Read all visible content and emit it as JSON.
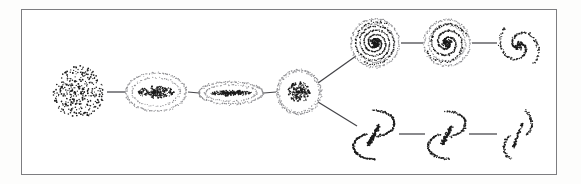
{
  "figure": {
    "background_color": "#ffffff",
    "page_color": "#fdfdfc",
    "frame": {
      "name": "figure-border",
      "x": 21,
      "y": 9,
      "width": 536,
      "height": 166,
      "stroke_color": "#7d7d80",
      "stroke_width": 1.2
    },
    "ink_color": "#1a1a1a",
    "halo_color": "#8a8a8e",
    "connector_color": "#444448"
  },
  "chart_data": {
    "type": "diagram",
    "subtitle": "",
    "xlabel": "",
    "ylabel": "",
    "legend": [],
    "grid": false,
    "render_style": "stippled point cloud",
    "branches": [
      {
        "id": "stem",
        "label": "Ellipticals and lenticular sequence",
        "node_ids": [
          "E0",
          "E3",
          "E7",
          "S0"
        ]
      },
      {
        "id": "upper",
        "label": "Normal spirals",
        "node_ids": [
          "Sa",
          "Sb",
          "Sc"
        ]
      },
      {
        "id": "lower",
        "label": "Barred spirals",
        "node_ids": [
          "SBa",
          "SBb",
          "SBc"
        ]
      }
    ],
    "nodes": [
      {
        "id": "E0",
        "label": "E0",
        "kind": "elliptical-blob",
        "branch": "stem",
        "cx": 78,
        "cy": 92,
        "rx": 26,
        "ry": 26,
        "point_count": 340,
        "core_density": 0.55,
        "halo": false
      },
      {
        "id": "E3",
        "label": "E3",
        "kind": "elliptical-ring-core",
        "branch": "stem",
        "cx": 156,
        "cy": 92,
        "rx": 30,
        "ry": 19,
        "core_rx": 18,
        "core_ry": 6,
        "point_count": 210,
        "core_density": 0.7,
        "halo": true
      },
      {
        "id": "E7",
        "label": "E7",
        "kind": "elliptical-ring-core",
        "branch": "stem",
        "cx": 231,
        "cy": 93,
        "rx": 32,
        "ry": 11,
        "core_rx": 21,
        "core_ry": 2.6,
        "point_count": 170,
        "core_density": 0.75,
        "halo": true
      },
      {
        "id": "S0",
        "label": "S0",
        "kind": "lenticular",
        "branch": "stem",
        "cx": 299,
        "cy": 92,
        "rx": 22,
        "ry": 22,
        "core_rx": 11,
        "core_ry": 10,
        "point_count": 200,
        "core_density": 0.8,
        "halo": true
      },
      {
        "id": "Sa",
        "label": "Sa",
        "kind": "spiral",
        "branch": "upper",
        "cx": 375,
        "cy": 43,
        "rx": 24,
        "ry": 24,
        "arms": 2,
        "turns": 2.35,
        "tightness": "tight",
        "point_count": 300,
        "core_density": 0.85,
        "halo": true
      },
      {
        "id": "Sb",
        "label": "Sb",
        "kind": "spiral",
        "branch": "upper",
        "cx": 447,
        "cy": 43,
        "rx": 23,
        "ry": 23,
        "arms": 2,
        "turns": 1.45,
        "tightness": "medium",
        "point_count": 240,
        "core_density": 0.65,
        "halo": true
      },
      {
        "id": "Sc",
        "label": "Sc",
        "kind": "spiral-open",
        "branch": "upper",
        "cx": 519,
        "cy": 46,
        "rx": 22,
        "ry": 26,
        "arms": 2,
        "turns": 0.78,
        "tightness": "loose",
        "point_count": 165,
        "core_density": 0.5,
        "halo": false
      },
      {
        "id": "SBa",
        "label": "SBa",
        "kind": "barred-spiral",
        "branch": "lower",
        "cx": 374,
        "cy": 135,
        "rx": 22,
        "ry": 28,
        "bar_length": 22,
        "bar_angle": -62,
        "tightness": "tight",
        "point_count": 300,
        "core_density": 0.8,
        "halo": true
      },
      {
        "id": "SBb",
        "label": "SBb",
        "kind": "barred-spiral",
        "branch": "lower",
        "cx": 447,
        "cy": 135,
        "rx": 20,
        "ry": 27,
        "bar_length": 20,
        "bar_angle": -62,
        "tightness": "medium",
        "point_count": 215,
        "core_density": 0.6,
        "halo": true
      },
      {
        "id": "SBc",
        "label": "SBc",
        "kind": "barred-spiral-open",
        "branch": "lower",
        "cx": 518,
        "cy": 135,
        "rx": 15,
        "ry": 29,
        "bar_length": 26,
        "bar_angle": -70,
        "tightness": "loose",
        "point_count": 150,
        "core_density": 0.45,
        "halo": false
      }
    ],
    "connectors": [
      {
        "id": "c-E0-E3",
        "from": "E0",
        "to": "E3",
        "x1": 107,
        "y1": 92,
        "x2": 125,
        "y2": 92
      },
      {
        "id": "c-E3-E7",
        "from": "E3",
        "to": "E7",
        "x1": 188,
        "y1": 92,
        "x2": 199,
        "y2": 93
      },
      {
        "id": "c-E7-S0",
        "from": "E7",
        "to": "S0",
        "x1": 264,
        "y1": 93,
        "x2": 276,
        "y2": 92
      },
      {
        "id": "c-S0-Sa",
        "from": "S0",
        "to": "Sa",
        "x1": 318,
        "y1": 83,
        "x2": 356,
        "y2": 56
      },
      {
        "id": "c-S0-SBa",
        "from": "S0",
        "to": "SBa",
        "x1": 318,
        "y1": 102,
        "x2": 357,
        "y2": 126
      },
      {
        "id": "c-Sa-Sb",
        "from": "Sa",
        "to": "Sb",
        "x1": 401,
        "y1": 43,
        "x2": 423,
        "y2": 43
      },
      {
        "id": "c-Sb-Sc",
        "from": "Sb",
        "to": "Sc",
        "x1": 472,
        "y1": 43,
        "x2": 497,
        "y2": 43
      },
      {
        "id": "c-SBa-SBb",
        "from": "SBa",
        "to": "SBb",
        "x1": 399,
        "y1": 134,
        "x2": 425,
        "y2": 134
      },
      {
        "id": "c-SBb-SBc",
        "from": "SBb",
        "to": "SBc",
        "x1": 469,
        "y1": 134,
        "x2": 497,
        "y2": 134
      }
    ]
  }
}
